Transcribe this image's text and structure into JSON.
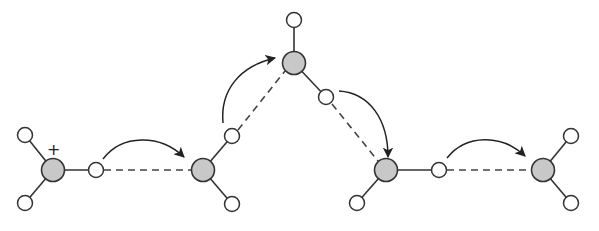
{
  "diagram": {
    "type": "hydride-shift-chain",
    "charge_label": "+",
    "colors": {
      "carbon_fill": "#c8c8c8",
      "hydrogen_fill": "#ffffff",
      "stroke": "#333333",
      "background": "#ffffff"
    },
    "carbons": [
      {
        "id": "C1",
        "x": 53,
        "y": 170,
        "charged": true
      },
      {
        "id": "C2",
        "x": 203,
        "y": 170
      },
      {
        "id": "C3",
        "x": 294,
        "y": 63
      },
      {
        "id": "C4",
        "x": 386,
        "y": 170
      },
      {
        "id": "C5",
        "x": 543,
        "y": 170
      }
    ],
    "hydrogens": [
      {
        "id": "H1a",
        "x": 25,
        "y": 135,
        "bonded_to": "C1"
      },
      {
        "id": "H1b",
        "x": 25,
        "y": 203,
        "bonded_to": "C1"
      },
      {
        "id": "Hb1",
        "x": 96,
        "y": 170,
        "bonded_to": "C1",
        "bridging_to": "C2"
      },
      {
        "id": "Hb2",
        "x": 232,
        "y": 136,
        "bonded_to": "C2",
        "bridging_to": "C3"
      },
      {
        "id": "H2b",
        "x": 232,
        "y": 204,
        "bonded_to": "C2"
      },
      {
        "id": "H3a",
        "x": 294,
        "y": 20,
        "bonded_to": "C3"
      },
      {
        "id": "Hb3",
        "x": 326,
        "y": 97,
        "bonded_to": "C3",
        "bridging_to": "C4"
      },
      {
        "id": "H4a",
        "x": 357,
        "y": 203,
        "bonded_to": "C4"
      },
      {
        "id": "Hb4",
        "x": 439,
        "y": 170,
        "bonded_to": "C4",
        "bridging_to": "C5"
      },
      {
        "id": "H5a",
        "x": 571,
        "y": 136,
        "bonded_to": "C5"
      },
      {
        "id": "H5b",
        "x": 571,
        "y": 203,
        "bonded_to": "C5"
      }
    ],
    "arrows": [
      {
        "from": "Hb1",
        "to": "C2"
      },
      {
        "from": "Hb2",
        "to": "C3"
      },
      {
        "from": "Hb3",
        "to": "C4"
      },
      {
        "from": "Hb4",
        "to": "C5"
      }
    ]
  }
}
